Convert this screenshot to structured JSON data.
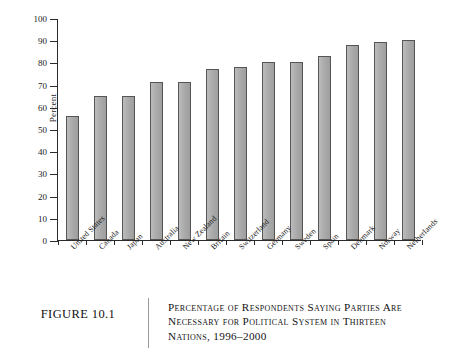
{
  "figure": {
    "number_label": "FIGURE 10.1",
    "caption_lines": [
      "Percentage of Respondents Saying Parties Are",
      "Necessary for Political System in Thirteen",
      "Nations, 1996–2000"
    ]
  },
  "chart_data": {
    "type": "bar",
    "xlabel": "",
    "ylabel": "Percent",
    "ylim": [
      0,
      100
    ],
    "ytick_step": 10,
    "grid": false,
    "legend": "none",
    "bar_color": "#a9a9a9",
    "bar_edge_color": "#555555",
    "categories": [
      "United States",
      "Canada",
      "Japan",
      "Australia",
      "New Zealand",
      "Britain",
      "Switzerland",
      "Germany",
      "Sweden",
      "Spain",
      "Denmark",
      "Norway",
      "Netherlands"
    ],
    "values": [
      56,
      65,
      65,
      71,
      71,
      77,
      78,
      80,
      80,
      83,
      88,
      89,
      90
    ],
    "ytick_labels": [
      "0",
      "10",
      "20",
      "30",
      "40",
      "50",
      "60",
      "70",
      "80",
      "90",
      "100"
    ]
  }
}
